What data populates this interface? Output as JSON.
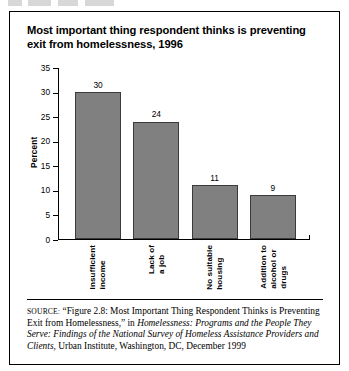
{
  "figure": {
    "title": "Most important thing respondent thinks is preventing exit from homelessness, 1996"
  },
  "chart_data": {
    "type": "bar",
    "title": "Most important thing respondent thinks is preventing exit from homelessness, 1996",
    "categories": [
      "Insufficient income",
      "Lack of a job",
      "No suitable housing",
      "Addition to alcohol or drugs"
    ],
    "category_lines": [
      [
        "Insufficient",
        "income"
      ],
      [
        "Lack of",
        "a job"
      ],
      [
        "No suitable",
        "housing"
      ],
      [
        "Addition to",
        "alcohol or",
        "drugs"
      ]
    ],
    "values": [
      30,
      24,
      11,
      9
    ],
    "value_labels": [
      "30",
      "24",
      "11",
      "9"
    ],
    "xlabel": "",
    "ylabel": "Percent",
    "ylim": [
      0,
      35
    ],
    "yticks": [
      35,
      30,
      25,
      20,
      15,
      10,
      5,
      0
    ],
    "ytick_labels": [
      "35",
      "30",
      "25",
      "20",
      "15",
      "10",
      "5",
      "0"
    ],
    "grid": false,
    "legend": false,
    "bar_color": "#808080",
    "bar_edge_color": "#3b3b3b"
  },
  "source": {
    "key": "SOURCE:",
    "part1": " “Figure 2.8: Most Important Thing Respondent Thinks is Preventing Exit from Homelessness,” in ",
    "italic": "Homelessness: Programs and the People They Serve: Findings of the National Survey of Homeless Assistance Providers and Clients",
    "part2": ", Urban Institute, Washington, DC, December 1999"
  }
}
